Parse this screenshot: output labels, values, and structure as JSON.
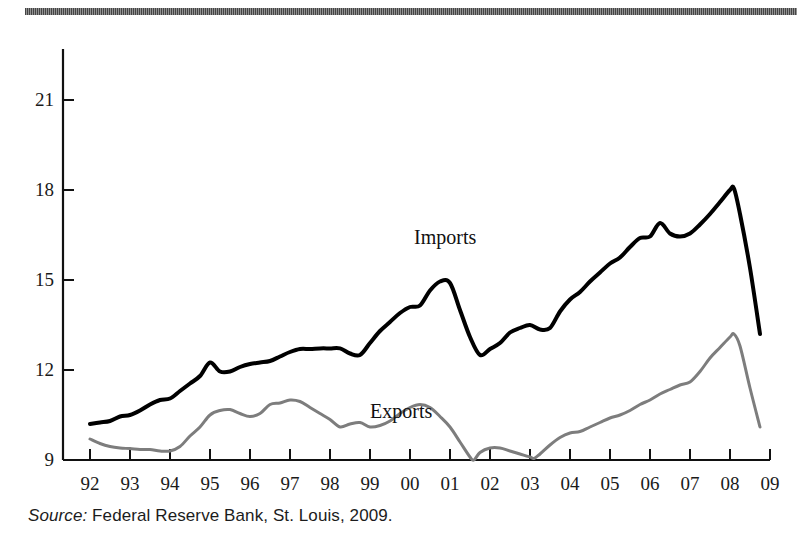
{
  "figure": {
    "top_rule": "decorative-rule",
    "source": {
      "prefix": "Source:",
      "text": " Federal Reserve Bank, St. Louis, 2009."
    }
  },
  "chart_data": {
    "type": "line",
    "title": "",
    "subtitle": "",
    "xlabel": "",
    "ylabel": "",
    "grid": false,
    "legend_position": "inline-annotation",
    "xlim": [
      1992,
      2009
    ],
    "ylim": [
      9,
      22.7
    ],
    "yticks": [
      9,
      12,
      15,
      18,
      21
    ],
    "ytick_labels": [
      "9",
      "12",
      "15",
      "18",
      "21"
    ],
    "x": [
      1992,
      2009
    ],
    "xtick_labels": [
      "92",
      "93",
      "94",
      "95",
      "96",
      "97",
      "98",
      "99",
      "00",
      "01",
      "02",
      "03",
      "04",
      "05",
      "06",
      "07",
      "08",
      "09"
    ],
    "series": [
      {
        "name": "Imports",
        "color": "#000000",
        "width": 4,
        "label_x": 1992,
        "points": [
          [
            1992.0,
            10.2
          ],
          [
            1992.25,
            10.25
          ],
          [
            1992.5,
            10.3
          ],
          [
            1992.75,
            10.45
          ],
          [
            1993.0,
            10.5
          ],
          [
            1993.25,
            10.65
          ],
          [
            1993.5,
            10.85
          ],
          [
            1993.75,
            11.0
          ],
          [
            1994.0,
            11.05
          ],
          [
            1994.25,
            11.3
          ],
          [
            1994.5,
            11.55
          ],
          [
            1994.75,
            11.8
          ],
          [
            1995.0,
            12.25
          ],
          [
            1995.25,
            11.95
          ],
          [
            1995.5,
            11.95
          ],
          [
            1995.75,
            12.1
          ],
          [
            1996.0,
            12.2
          ],
          [
            1996.25,
            12.25
          ],
          [
            1996.5,
            12.3
          ],
          [
            1996.75,
            12.45
          ],
          [
            1997.0,
            12.6
          ],
          [
            1997.25,
            12.7
          ],
          [
            1997.5,
            12.7
          ],
          [
            1997.75,
            12.72
          ],
          [
            1998.0,
            12.72
          ],
          [
            1998.25,
            12.72
          ],
          [
            1998.5,
            12.55
          ],
          [
            1998.75,
            12.5
          ],
          [
            1999.0,
            12.9
          ],
          [
            1999.25,
            13.3
          ],
          [
            1999.5,
            13.6
          ],
          [
            1999.75,
            13.9
          ],
          [
            2000.0,
            14.1
          ],
          [
            2000.25,
            14.15
          ],
          [
            2000.5,
            14.65
          ],
          [
            2000.75,
            14.95
          ],
          [
            2001.0,
            14.9
          ],
          [
            2001.25,
            14.0
          ],
          [
            2001.5,
            13.1
          ],
          [
            2001.75,
            12.5
          ],
          [
            2002.0,
            12.7
          ],
          [
            2002.25,
            12.9
          ],
          [
            2002.5,
            13.25
          ],
          [
            2002.75,
            13.4
          ],
          [
            2003.0,
            13.5
          ],
          [
            2003.25,
            13.35
          ],
          [
            2003.5,
            13.4
          ],
          [
            2003.75,
            13.95
          ],
          [
            2004.0,
            14.35
          ],
          [
            2004.25,
            14.6
          ],
          [
            2004.5,
            14.95
          ],
          [
            2004.75,
            15.25
          ],
          [
            2005.0,
            15.55
          ],
          [
            2005.25,
            15.75
          ],
          [
            2005.5,
            16.1
          ],
          [
            2005.75,
            16.4
          ],
          [
            2006.0,
            16.45
          ],
          [
            2006.25,
            16.9
          ],
          [
            2006.5,
            16.55
          ],
          [
            2006.75,
            16.45
          ],
          [
            2007.0,
            16.55
          ],
          [
            2007.25,
            16.85
          ],
          [
            2007.5,
            17.2
          ],
          [
            2007.75,
            17.6
          ],
          [
            2008.0,
            18.0
          ],
          [
            2008.1,
            18.05
          ],
          [
            2008.25,
            17.2
          ],
          [
            2008.5,
            15.4
          ],
          [
            2008.75,
            13.2
          ]
        ]
      },
      {
        "name": "Exports",
        "color": "#7d7d7d",
        "width": 3,
        "points": [
          [
            1992.0,
            9.7
          ],
          [
            1992.25,
            9.55
          ],
          [
            1992.5,
            9.45
          ],
          [
            1992.75,
            9.4
          ],
          [
            1993.0,
            9.38
          ],
          [
            1993.25,
            9.35
          ],
          [
            1993.5,
            9.35
          ],
          [
            1993.75,
            9.3
          ],
          [
            1994.0,
            9.3
          ],
          [
            1994.25,
            9.45
          ],
          [
            1994.5,
            9.8
          ],
          [
            1994.75,
            10.1
          ],
          [
            1995.0,
            10.5
          ],
          [
            1995.25,
            10.65
          ],
          [
            1995.5,
            10.68
          ],
          [
            1995.75,
            10.55
          ],
          [
            1996.0,
            10.45
          ],
          [
            1996.25,
            10.55
          ],
          [
            1996.5,
            10.85
          ],
          [
            1996.75,
            10.9
          ],
          [
            1997.0,
            11.0
          ],
          [
            1997.25,
            10.95
          ],
          [
            1997.5,
            10.75
          ],
          [
            1997.75,
            10.55
          ],
          [
            1998.0,
            10.35
          ],
          [
            1998.25,
            10.1
          ],
          [
            1998.5,
            10.2
          ],
          [
            1998.75,
            10.25
          ],
          [
            1999.0,
            10.1
          ],
          [
            1999.25,
            10.15
          ],
          [
            1999.5,
            10.3
          ],
          [
            1999.75,
            10.55
          ],
          [
            2000.0,
            10.75
          ],
          [
            2000.25,
            10.85
          ],
          [
            2000.5,
            10.75
          ],
          [
            2000.75,
            10.45
          ],
          [
            2001.0,
            10.1
          ],
          [
            2001.25,
            9.6
          ],
          [
            2001.5,
            9.1
          ],
          [
            2001.6,
            9.0
          ],
          [
            2001.75,
            9.25
          ],
          [
            2002.0,
            9.4
          ],
          [
            2002.25,
            9.4
          ],
          [
            2002.5,
            9.3
          ],
          [
            2002.75,
            9.2
          ],
          [
            2003.0,
            9.1
          ],
          [
            2003.1,
            9.05
          ],
          [
            2003.25,
            9.2
          ],
          [
            2003.5,
            9.5
          ],
          [
            2003.75,
            9.75
          ],
          [
            2004.0,
            9.9
          ],
          [
            2004.25,
            9.95
          ],
          [
            2004.5,
            10.1
          ],
          [
            2004.75,
            10.25
          ],
          [
            2005.0,
            10.4
          ],
          [
            2005.25,
            10.5
          ],
          [
            2005.5,
            10.65
          ],
          [
            2005.75,
            10.85
          ],
          [
            2006.0,
            11.0
          ],
          [
            2006.25,
            11.2
          ],
          [
            2006.5,
            11.35
          ],
          [
            2006.75,
            11.5
          ],
          [
            2007.0,
            11.6
          ],
          [
            2007.25,
            11.95
          ],
          [
            2007.5,
            12.4
          ],
          [
            2007.75,
            12.75
          ],
          [
            2008.0,
            13.1
          ],
          [
            2008.1,
            13.2
          ],
          [
            2008.25,
            12.8
          ],
          [
            2008.5,
            11.4
          ],
          [
            2008.75,
            10.1
          ]
        ]
      }
    ],
    "annotations": [
      {
        "text": "Imports",
        "x": 2001.6,
        "y": 16.4
      },
      {
        "text": "Exports",
        "x": 2000.5,
        "y": 10.6
      }
    ]
  }
}
